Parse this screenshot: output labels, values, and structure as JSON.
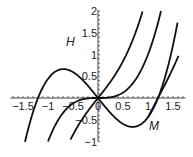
{
  "chart_data": {
    "type": "line",
    "title": "",
    "xlabel": "M",
    "ylabel": "H",
    "xlim": [
      -1.75,
      1.75
    ],
    "ylim": [
      -1,
      2
    ],
    "grid": false,
    "x_ticks": [
      "-1.5",
      "-1",
      "-0.5",
      "0",
      "0.5",
      "1",
      "1.5"
    ],
    "y_ticks": [
      "-1",
      "-0.5",
      "0",
      "0.5",
      "1",
      "1.5",
      "2"
    ],
    "series": [
      {
        "name": "H = M^3 - 1.44M",
        "x": [
          -1.55,
          -1.2,
          -0.9,
          -0.69,
          -0.4,
          0,
          0.4,
          0.69,
          0.9,
          1.2,
          1.48
        ],
        "y": [
          -1.49,
          0,
          0.57,
          0.66,
          0.51,
          0,
          -0.51,
          -0.66,
          -0.57,
          0,
          1.11
        ]
      },
      {
        "name": "H = M^3",
        "x": [
          -1.0,
          -0.7,
          -0.4,
          0,
          0.4,
          0.7,
          1.0,
          1.26
        ],
        "y": [
          -1.0,
          -0.34,
          -0.06,
          0,
          0.06,
          0.34,
          1.0,
          2.0
        ]
      },
      {
        "name": "H = M^3 + 1.44M",
        "x": [
          -0.5,
          -0.3,
          0,
          0.3,
          0.6,
          0.8,
          0.88
        ],
        "y": [
          -0.85,
          -0.46,
          0,
          0.46,
          1.08,
          1.66,
          2.0
        ]
      },
      {
        "name": "right branch",
        "x": [
          1.15,
          1.2,
          1.3,
          1.45,
          1.6
        ],
        "y": [
          -0.4,
          0,
          0.45,
          1.2,
          2.0
        ]
      }
    ],
    "annotations": [
      {
        "text": "H",
        "x": -0.5,
        "y": 1.4
      },
      {
        "text": "M",
        "x": 1.1,
        "y": -0.7
      }
    ]
  },
  "labels": {
    "h": "H",
    "m": "M"
  },
  "ticks": {
    "x": [
      "−1.5",
      "−1",
      "−0.5",
      "0",
      "0.5",
      "1",
      "1.5"
    ],
    "y": [
      "−1",
      "−0.5",
      "0",
      "0.5",
      "1",
      "1.5",
      "2"
    ]
  }
}
